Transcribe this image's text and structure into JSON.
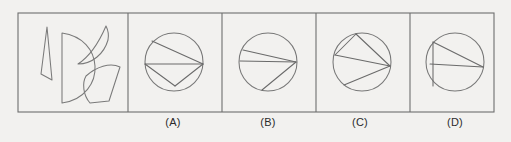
{
  "figure": {
    "kind": "shape-assembly-multiple-choice",
    "background_color": "#f2f1ef",
    "line_color": "#6e6e6e",
    "frame": {
      "x": 18,
      "y": 13,
      "width": 476,
      "height": 99
    },
    "divider_x": [
      128,
      222,
      316,
      410
    ]
  },
  "prompt_panel": {
    "name": "pieces-panel",
    "pieces": [
      {
        "id": "piece-sliver-triangle",
        "label": "thin sliver triangle",
        "path": "M 47 27 L 41 74 L 52 80 L 47 27 Z"
      },
      {
        "id": "piece-crescent",
        "label": "crescent",
        "path": "M 106 26 C 100 40 92 55 78 64 C 92 64 104 54 108 40 C 109 35 108 30 106 26 Z"
      },
      {
        "id": "piece-half-disk",
        "label": "half disk",
        "path": "M 62 33 L 62 103 C 85 100 96 82 95 66 C 94 50 83 36 62 33 Z"
      },
      {
        "id": "piece-sector-fan",
        "label": "fan sector",
        "path": "M 86 76 C 96 67 110 62 120 67 L 109 101 L 90 103 C 83 95 82 83 86 76 Z"
      }
    ]
  },
  "options": [
    {
      "id": "option-a",
      "label": "(A)",
      "label_x": 173,
      "label_y": 123,
      "circle": {
        "cx": 174,
        "cy": 62,
        "r": 29
      },
      "chords": [
        {
          "name": "horizontal-diameter",
          "x1": 145,
          "y1": 64,
          "x2": 203,
          "y2": 64
        },
        {
          "name": "upper-diagonal",
          "x1": 152,
          "y1": 41,
          "x2": 203,
          "y2": 64
        },
        {
          "name": "lower-v-left",
          "x1": 145,
          "y1": 64,
          "x2": 175,
          "y2": 86
        },
        {
          "name": "lower-v-right",
          "x1": 175,
          "y1": 86,
          "x2": 203,
          "y2": 64
        }
      ]
    },
    {
      "id": "option-b",
      "label": "(B)",
      "label_x": 268,
      "label_y": 123,
      "circle": {
        "cx": 268,
        "cy": 62,
        "r": 29
      },
      "chords": [
        {
          "name": "upper-chord",
          "x1": 243,
          "y1": 50,
          "x2": 296,
          "y2": 62
        },
        {
          "name": "mid-chord",
          "x1": 240,
          "y1": 61,
          "x2": 296,
          "y2": 62
        },
        {
          "name": "lower-diagonal",
          "x1": 296,
          "y1": 62,
          "x2": 262,
          "y2": 90
        }
      ]
    },
    {
      "id": "option-c",
      "label": "(C)",
      "label_x": 360,
      "label_y": 123,
      "circle": {
        "cx": 362,
        "cy": 62,
        "r": 29
      },
      "chords": [
        {
          "name": "top-chord",
          "x1": 356,
          "y1": 34,
          "x2": 390,
          "y2": 66
        },
        {
          "name": "upper-left-chord",
          "x1": 356,
          "y1": 34,
          "x2": 335,
          "y2": 55
        },
        {
          "name": "left-to-vertex",
          "x1": 335,
          "y1": 55,
          "x2": 390,
          "y2": 66
        },
        {
          "name": "lower-chord",
          "x1": 390,
          "y1": 66,
          "x2": 344,
          "y2": 85
        }
      ]
    },
    {
      "id": "option-d",
      "label": "(D)",
      "label_x": 455,
      "label_y": 123,
      "circle": {
        "cx": 455,
        "cy": 62,
        "r": 29
      },
      "chords": [
        {
          "name": "vertical-left-chord",
          "x1": 433,
          "y1": 42,
          "x2": 433,
          "y2": 86
        },
        {
          "name": "upper-diagonal",
          "x1": 433,
          "y1": 42,
          "x2": 483,
          "y2": 67
        },
        {
          "name": "horizontal-chord",
          "x1": 430,
          "y1": 64,
          "x2": 483,
          "y2": 67
        }
      ]
    }
  ]
}
